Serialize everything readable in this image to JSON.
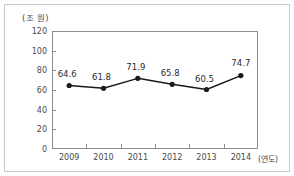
{
  "chart_data": {
    "type": "line",
    "title": "",
    "subtitle": "",
    "unit_label": "(조 원)",
    "xlabel": "(연도)",
    "ylabel": "",
    "categories": [
      "2009",
      "2010",
      "2011",
      "2012",
      "2013",
      "2014"
    ],
    "values": [
      64.6,
      61.8,
      71.9,
      65.8,
      60.5,
      74.7
    ],
    "data_labels": [
      "64.6",
      "61.8",
      "71.9",
      "65.8",
      "60.5",
      "74.7"
    ],
    "series": [
      {
        "name": "",
        "values": [
          64.6,
          61.8,
          71.9,
          65.8,
          60.5,
          74.7
        ]
      }
    ],
    "ylim": [
      0,
      120
    ],
    "yticks": [
      0,
      20,
      40,
      60,
      80,
      100,
      120
    ],
    "ytick_labels": [
      "0",
      "20",
      "40",
      "60",
      "80",
      "100",
      "120"
    ],
    "grid": false,
    "legend": false,
    "legend_position": "none",
    "marker": "filled-circle",
    "line_color": "#1a1a1a",
    "marker_color": "#1a1a1a",
    "axis_color": "#8c8c8c",
    "text_color": "#4a4a4a",
    "background_color": "#ffffff"
  }
}
